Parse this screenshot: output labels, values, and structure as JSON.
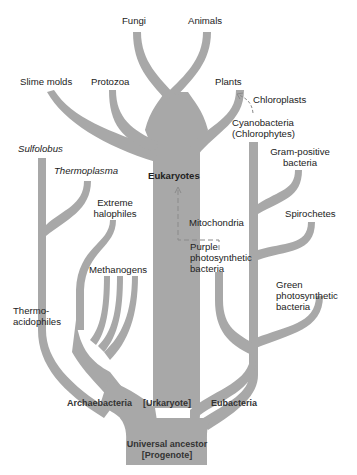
{
  "diagram": {
    "type": "phylogenetic-tree",
    "branch_color": "#a8a8a8",
    "dash_color": "#8a8a8a",
    "root": {
      "line1": "Universal ancestor",
      "line2": "[Progenote]"
    },
    "domains": {
      "archaebacteria": "Archaebacteria",
      "urkaryote": "[Urkaryote]",
      "eubacteria": "Eubacteria"
    },
    "eukaryotes": {
      "label": "Eukaryotes",
      "leaves": {
        "fungi": "Fungi",
        "animals": "Animals",
        "slime_molds": "Slime molds",
        "protozoa": "Protozoa",
        "plants": "Plants"
      }
    },
    "archaea_leaves": {
      "sulfolobus": "Sulfolobus",
      "thermoplasma": "Thermoplasma",
      "extreme_halophiles_1": "Extreme",
      "extreme_halophiles_2": "halophiles",
      "methanogens": "Methanogens",
      "thermoacidophiles_1": "Thermo-",
      "thermoacidophiles_2": "acidophiles"
    },
    "bacteria_leaves": {
      "cyanobacteria_1": "Cyanobacteria",
      "cyanobacteria_2": "(Chlorophytes)",
      "gram_positive_1": "Gram-positive",
      "gram_positive_2": "bacteria",
      "spirochetes": "Spirochetes",
      "purple_1": "Purple",
      "purple_2": "photosynthetic",
      "purple_3": "bacteria",
      "green_1": "Green",
      "green_2": "photosynthetic",
      "green_3": "bacteria"
    },
    "endosymbiosis": {
      "chloroplasts": "Chloroplasts",
      "mitochondria": "Mitochondria"
    }
  }
}
